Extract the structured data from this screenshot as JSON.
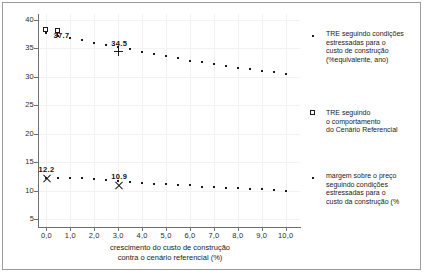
{
  "chart_data": {
    "type": "scatter",
    "title": "",
    "xlabel_lines": [
      "crescimento do custo de construção",
      "contra o cenário referencial (%)"
    ],
    "ylabel": "",
    "xlim": [
      -0.35,
      10.6
    ],
    "ylim": [
      3.6,
      41
    ],
    "xticks": [
      "0,0",
      "1,0",
      "2,0",
      "3,0",
      "4,0",
      "5,0",
      "6,0",
      "7,0",
      "8,0",
      "9,0",
      "10,0"
    ],
    "xtick_values": [
      0,
      1,
      2,
      3,
      4,
      5,
      6,
      7,
      8,
      9,
      10
    ],
    "yticks": [
      "40",
      "35",
      "30",
      "25",
      "20",
      "15",
      "10",
      "5"
    ],
    "ytick_values": [
      40,
      35,
      30,
      25,
      20,
      15,
      10,
      5
    ],
    "grid": true,
    "legend_position": "right",
    "series": [
      {
        "name": "TRE seguindo condições estressadas para o custo de construção (%equivalente, ano)",
        "marker": "dot",
        "x": [
          0.0,
          0.5,
          1.0,
          1.5,
          2.0,
          2.5,
          3.0,
          3.5,
          4.0,
          4.5,
          5.0,
          5.5,
          6.0,
          6.5,
          7.0,
          7.5,
          8.0,
          8.5,
          9.0,
          9.5,
          10.0
        ],
        "y": [
          37.7,
          37.2,
          36.8,
          36.4,
          36.0,
          35.6,
          35.2,
          34.8,
          34.4,
          34.0,
          33.6,
          33.2,
          32.8,
          32.5,
          32.2,
          31.9,
          31.6,
          31.3,
          31.0,
          30.8,
          30.5
        ]
      },
      {
        "name": "margem sobre o preço seguindo condições estressadas para o custo da construção (%)",
        "marker": "dot",
        "x": [
          0.0,
          0.5,
          1.0,
          1.5,
          2.0,
          2.5,
          3.0,
          3.5,
          4.0,
          4.5,
          5.0,
          5.5,
          6.0,
          6.5,
          7.0,
          7.5,
          8.0,
          8.5,
          9.0,
          9.5,
          10.0
        ],
        "y": [
          12.2,
          12.3,
          12.2,
          12.2,
          12.1,
          11.9,
          11.7,
          11.5,
          11.4,
          11.2,
          11.1,
          11.0,
          10.9,
          10.7,
          10.6,
          10.5,
          10.4,
          10.3,
          10.2,
          10.1,
          10.0
        ]
      }
    ],
    "annotations": [
      {
        "label": "37.7",
        "x": 0.0,
        "y": 37.7,
        "series": "TRE"
      },
      {
        "label": "34.5",
        "x": 3.0,
        "y": 34.5,
        "series": "TRE",
        "marker": "plus"
      },
      {
        "label": "12.2",
        "x": 0.0,
        "y": 12.2,
        "series": "margem",
        "marker": "x"
      },
      {
        "label": "10.9",
        "x": 3.0,
        "y": 10.9,
        "series": "margem",
        "marker": "x"
      }
    ],
    "reference_markers": [
      {
        "x": 0.0,
        "y": 38.2,
        "marker": "square",
        "name": "TRE seguindo o comportamento do Cenário Referencial"
      },
      {
        "x": 0.5,
        "y": 38.1,
        "marker": "square-stem",
        "name": "TRE seguindo o comportamento do Cenário Referencial"
      }
    ]
  },
  "legend": {
    "entries": [
      {
        "marker": "dot",
        "lines": [
          "TRE seguindo condições",
          "estressadas para o",
          "custo de construção",
          "(%equivalente, ano)"
        ]
      },
      {
        "marker": "square",
        "lines": [
          "TRE seguindo",
          "o comportamento",
          "do Cenário Referencial"
        ]
      },
      {
        "marker": "dot",
        "lines": [
          "margem sobre o preço",
          "seguindo condições",
          "estressadas para o",
          "custo da construção (%"
        ]
      }
    ]
  },
  "axis": {
    "x_title_line1": "crescimento do custo de construção",
    "x_title_line2": "contra o cenário referencial (%)"
  }
}
